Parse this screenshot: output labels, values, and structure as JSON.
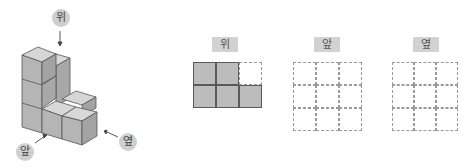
{
  "figure": {
    "labels": {
      "top": "위",
      "front": "앞",
      "side": "옆"
    },
    "colors": {
      "cube_front": "#b3b3b3",
      "cube_top": "#d6d6d6",
      "cube_side": "#a3a3a3",
      "edge": "#555555",
      "label_bg": "#cfcfcf"
    }
  },
  "views": [
    {
      "id": "top",
      "label": "위",
      "rows": 2,
      "cols": 3,
      "cells": [
        [
          1,
          1,
          0
        ],
        [
          1,
          1,
          1
        ]
      ]
    },
    {
      "id": "front",
      "label": "앞",
      "rows": 3,
      "cols": 3,
      "cells": [
        [
          0,
          0,
          0
        ],
        [
          0,
          0,
          0
        ],
        [
          0,
          0,
          0
        ]
      ]
    },
    {
      "id": "side",
      "label": "옆",
      "rows": 3,
      "cols": 3,
      "cells": [
        [
          0,
          0,
          0
        ],
        [
          0,
          0,
          0
        ],
        [
          0,
          0,
          0
        ]
      ]
    }
  ]
}
